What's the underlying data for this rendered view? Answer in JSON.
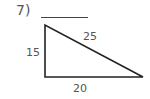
{
  "problem": {
    "number": "7)",
    "answer_blank": ""
  },
  "triangle": {
    "side_left": "15",
    "side_hypotenuse": "25",
    "side_bottom": "20",
    "stroke_color": "#222222"
  }
}
